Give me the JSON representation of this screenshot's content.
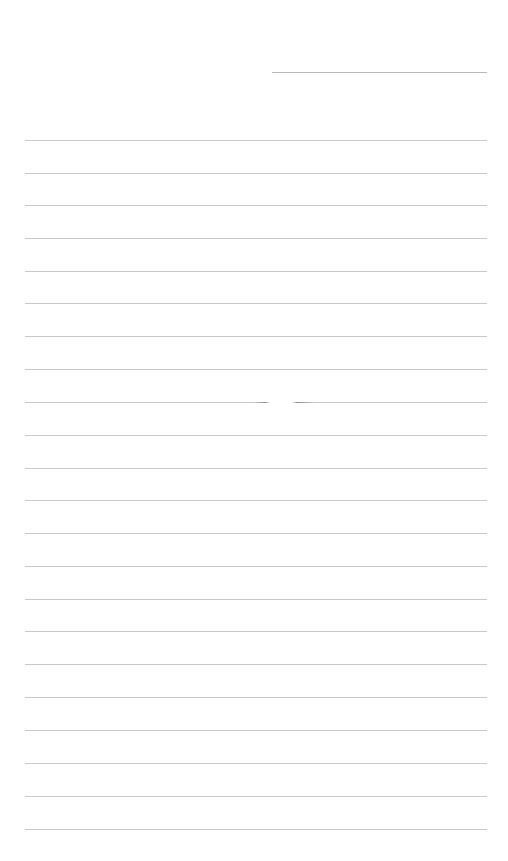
{
  "page": {
    "type": "lined-paper",
    "background": "#ffffff",
    "line_color": "#c9c9c9",
    "header_line": {
      "x1": 272,
      "x2": 487,
      "y": 72
    },
    "ruled_lines": {
      "x1": 25,
      "x2": 487,
      "y_positions": [
        140,
        173,
        205,
        238,
        271,
        303,
        336,
        369,
        402,
        435,
        468,
        500,
        533,
        566,
        599,
        631,
        664,
        697,
        730,
        763,
        796,
        829
      ]
    },
    "text_content": []
  }
}
